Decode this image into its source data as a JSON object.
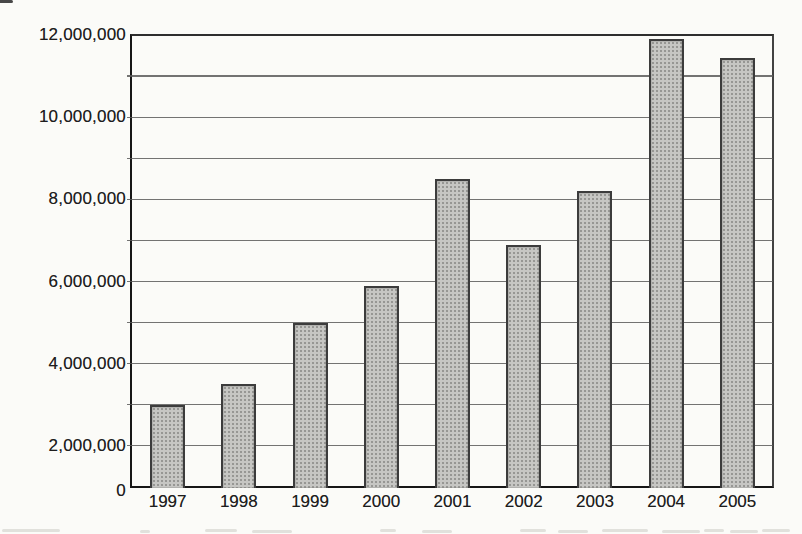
{
  "page": {
    "background_color": "#fbfbf8"
  },
  "chart_data": {
    "type": "bar",
    "title": "",
    "xlabel": "",
    "ylabel": "",
    "categories": [
      "1997",
      "1998",
      "1999",
      "2000",
      "2001",
      "2002",
      "2003",
      "2004",
      "2005"
    ],
    "values": [
      3000000,
      3500000,
      5000000,
      5900000,
      8500000,
      6900000,
      8200000,
      11900000,
      11450000
    ],
    "ylim": [
      0,
      12000000
    ],
    "grid": "horizontal gridlines at every axis row; labels every 2,000,000",
    "axis_note": "source scan: rows from 12,000,000 down to 2,000,000 are 1,000,000 each; the single bottom row spans 2,000,000 to 0",
    "legend_position": "none",
    "y_tick_labels": [
      {
        "label": "12,000,000",
        "row": 0,
        "dy": 0
      },
      {
        "label": "10,000,000",
        "row": 2,
        "dy": 0
      },
      {
        "label": "8,000,000",
        "row": 4,
        "dy": 0
      },
      {
        "label": "6,000,000",
        "row": 6,
        "dy": 0
      },
      {
        "label": "4,000,000",
        "row": 8,
        "dy": 0
      },
      {
        "label": "2,000,000",
        "row": 10,
        "dy": 0
      },
      {
        "label": "0",
        "row": 11,
        "dy": 4
      }
    ],
    "colors": {
      "bar_fill": "#c6c6c3",
      "bar_halftone_dot": "#6f6f6d",
      "bar_border": "#3c3c3c",
      "axis": "#161616",
      "gridline": "#5a5a5a",
      "text": "#1d1d1d",
      "background": "#fbfbf8"
    }
  }
}
